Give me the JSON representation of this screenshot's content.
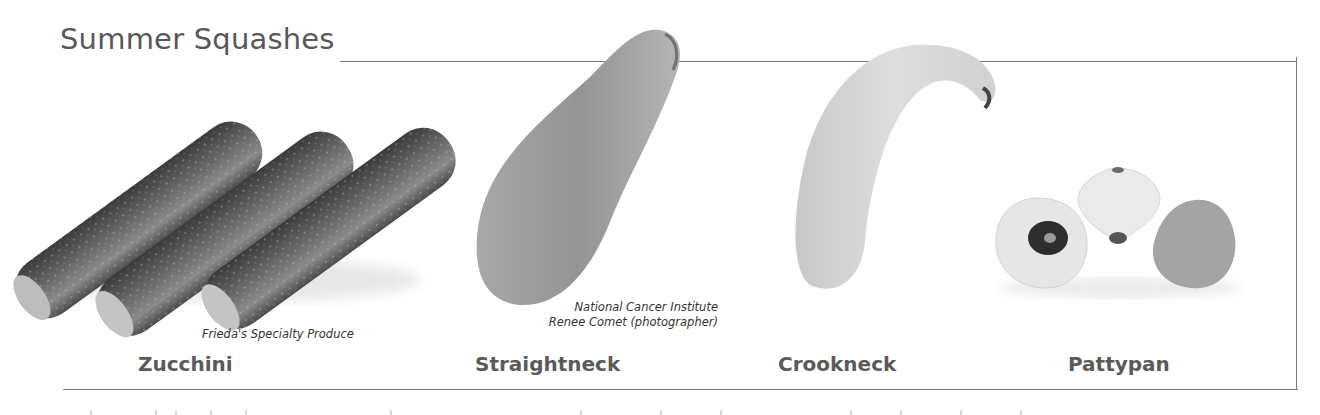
{
  "header": {
    "title": "Summer Squashes"
  },
  "squashes": [
    {
      "name": "Zucchini",
      "credit": [
        "Frieda's Specialty Produce"
      ]
    },
    {
      "name": "Straightneck",
      "credit": [
        "National Cancer Institute",
        "Renee Comet (photographer)"
      ]
    },
    {
      "name": "Crookneck",
      "credit": []
    },
    {
      "name": "Pattypan",
      "credit": []
    }
  ],
  "colors": {
    "text": "#555555",
    "rule": "#7a7a7a",
    "background": "#ffffff"
  }
}
